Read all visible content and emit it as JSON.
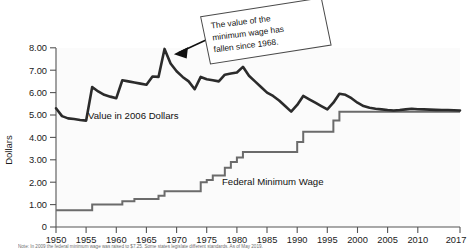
{
  "chart_data": {
    "type": "line",
    "title": "",
    "xlabel": "",
    "ylabel": "Dollars",
    "xlim": [
      1950,
      2017
    ],
    "ylim": [
      0,
      8
    ],
    "grid": false,
    "legend_position": "inline-annotations",
    "ytick_labels": [
      "0",
      "1.00",
      "2.00",
      "3.00",
      "4.00",
      "5.00",
      "6.00",
      "7.00",
      "8.00"
    ],
    "ytick_values": [
      0,
      1,
      2,
      3,
      4,
      5,
      6,
      7,
      8
    ],
    "xtick_labels": [
      "1950",
      "1955",
      "1960",
      "1965",
      "1970",
      "1975",
      "1980",
      "1985",
      "1990",
      "1995",
      "2000",
      "2005",
      "2010",
      "2017"
    ],
    "xtick_values": [
      1950,
      1955,
      1960,
      1965,
      1970,
      1975,
      1980,
      1985,
      1990,
      1995,
      2000,
      2005,
      2010,
      2017
    ],
    "series": [
      {
        "name": "Value in 2006 Dollars",
        "style": "line",
        "color": "#2b2b2b",
        "x": [
          1950,
          1951,
          1952,
          1953,
          1954,
          1955,
          1956,
          1957,
          1958,
          1959,
          1960,
          1961,
          1962,
          1963,
          1964,
          1965,
          1966,
          1967,
          1968,
          1969,
          1970,
          1971,
          1972,
          1973,
          1974,
          1975,
          1976,
          1977,
          1978,
          1979,
          1980,
          1981,
          1982,
          1983,
          1984,
          1985,
          1986,
          1987,
          1988,
          1989,
          1990,
          1991,
          1992,
          1993,
          1994,
          1995,
          1996,
          1997,
          1998,
          1999,
          2000,
          2001,
          2002,
          2003,
          2004,
          2005,
          2006,
          2007,
          2008,
          2009,
          2010,
          2011,
          2012,
          2013,
          2014,
          2015,
          2016,
          2017
        ],
        "y": [
          5.3,
          4.95,
          4.85,
          4.82,
          4.78,
          4.75,
          6.25,
          6.05,
          5.9,
          5.82,
          5.75,
          6.55,
          6.5,
          6.45,
          6.4,
          6.35,
          6.72,
          6.7,
          7.95,
          7.3,
          6.95,
          6.7,
          6.5,
          6.15,
          6.7,
          6.6,
          6.55,
          6.5,
          6.8,
          6.85,
          6.9,
          7.15,
          6.75,
          6.5,
          6.25,
          6.0,
          5.85,
          5.65,
          5.4,
          5.15,
          5.45,
          5.85,
          5.7,
          5.55,
          5.4,
          5.25,
          5.55,
          5.95,
          5.9,
          5.75,
          5.55,
          5.4,
          5.32,
          5.28,
          5.25,
          5.22,
          5.2,
          5.22,
          5.25,
          5.28,
          5.26,
          5.25,
          5.24,
          5.23,
          5.22,
          5.22,
          5.21,
          5.2
        ]
      },
      {
        "name": "Federal Minimum Wage",
        "style": "step",
        "color": "#6b6b6b",
        "x": [
          1950,
          1956,
          1961,
          1963,
          1967,
          1968,
          1974,
          1975,
          1976,
          1978,
          1979,
          1980,
          1981,
          1990,
          1991,
          1996,
          1997,
          2007,
          2008,
          2009,
          2017
        ],
        "y": [
          0.75,
          1.0,
          1.15,
          1.25,
          1.4,
          1.6,
          2.0,
          2.1,
          2.3,
          2.65,
          2.9,
          3.1,
          3.35,
          3.8,
          4.25,
          4.75,
          5.15,
          5.15,
          5.15,
          5.15,
          5.15
        ]
      }
    ],
    "annotations": [
      {
        "id": "callout",
        "text_lines": [
          "The value of the",
          "minimum wage has",
          "fallen since 1968."
        ],
        "points_to_year": 1968,
        "points_to_value": 7.95
      },
      {
        "id": "label-real",
        "text": "Value in 2006 Dollars"
      },
      {
        "id": "label-nominal",
        "text": "Federal Minimum Wage"
      }
    ],
    "footnote": "Note: In 2009 the federal minimum wage was raised to $7.25. Some states legislate different standards. As of May 2019."
  },
  "colors": {
    "real_line": "#2b2b2b",
    "nominal_line": "#6b6b6b",
    "axis": "#555555",
    "text": "#1a1a1a",
    "plot_bg": "#fbfbfb",
    "page_bg": "#ffffff"
  }
}
